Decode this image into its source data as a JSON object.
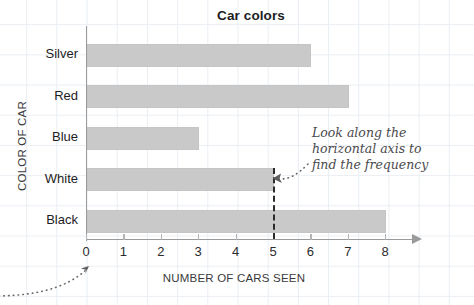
{
  "chart_data": {
    "type": "bar",
    "orientation": "horizontal",
    "title": "Car colors",
    "xlabel": "NUMBER OF CARS SEEN",
    "ylabel": "COLOR OF CAR",
    "categories": [
      "Silver",
      "Red",
      "Blue",
      "White",
      "Black"
    ],
    "values": [
      6,
      7,
      3,
      5,
      8
    ],
    "xlim": [
      0,
      8
    ],
    "xticks": [
      0,
      1,
      2,
      3,
      4,
      5,
      6,
      7,
      8
    ],
    "xtick_labels": [
      "0",
      "1",
      "2",
      "3",
      "4",
      "5",
      "6",
      "7",
      "8"
    ],
    "grid": true,
    "legend": "none",
    "bar_color": "#c9c9c9",
    "annotations": [
      {
        "name": "frequency-note",
        "text": "Look along the horizontal axis to find the frequency",
        "lines": [
          "Look along the",
          "horizontal axis to",
          "find the frequency"
        ],
        "points_to": 5
      },
      {
        "name": "origin-arrow",
        "text": "",
        "points_to": 0
      }
    ],
    "guide_line": {
      "name": "frequency-guide",
      "value": 5,
      "style": "dashed",
      "color": "#2b2b2b"
    }
  },
  "colors": {
    "grid": "#e9eef3",
    "axis": "#9a9a9a",
    "bar": "#c9c9c9",
    "text": "#1d1d1f",
    "annotation": "#4a4a4c"
  }
}
